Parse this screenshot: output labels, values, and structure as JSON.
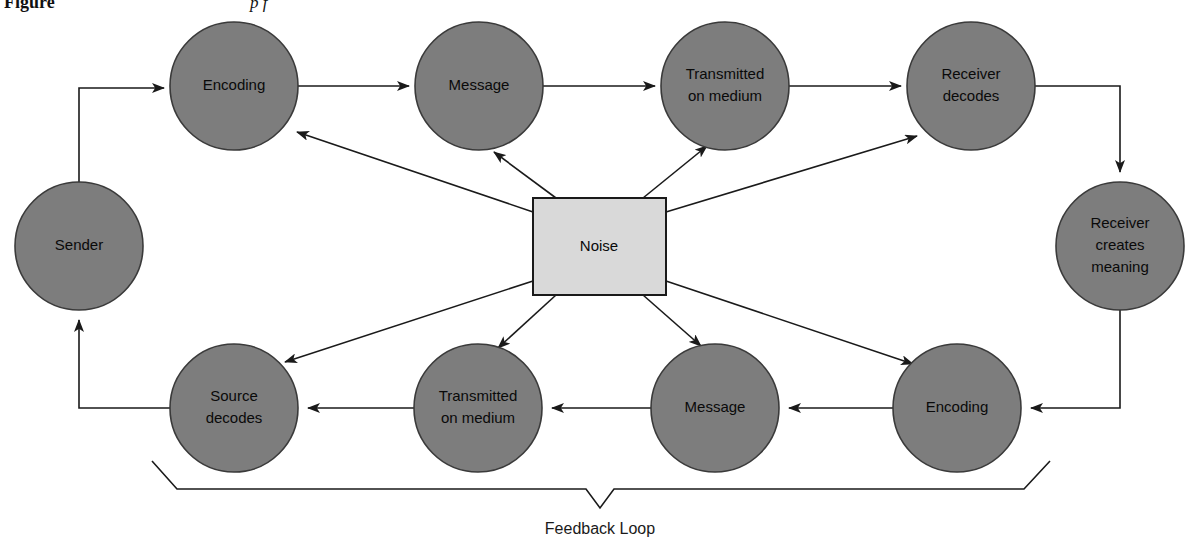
{
  "figure": {
    "caption_label": "Figure",
    "caption_text": "p            f",
    "feedback_label": "Feedback Loop"
  },
  "colors": {
    "circle_fill": "#7d7d7d",
    "circle_stroke": "#3a3a3a",
    "noise_fill": "#d9d9d9",
    "noise_stroke": "#1a1a1a",
    "line": "#1a1a1a",
    "background": "#ffffff",
    "text": "#0a0a0a"
  },
  "diagram": {
    "nodes": [
      {
        "id": "sender",
        "label": "Sender",
        "lines": [
          "Sender"
        ],
        "cx": 79,
        "cy": 246,
        "r": 64,
        "shape": "circle",
        "row": "left"
      },
      {
        "id": "encoding-top",
        "label": "Encoding",
        "lines": [
          "Encoding"
        ],
        "cx": 234,
        "cy": 86,
        "r": 64,
        "shape": "circle",
        "row": "top"
      },
      {
        "id": "message-top",
        "label": "Message",
        "lines": [
          "Message"
        ],
        "cx": 479,
        "cy": 86,
        "r": 64,
        "shape": "circle",
        "row": "top"
      },
      {
        "id": "transmitted-top",
        "label": "Transmitted on medium",
        "lines": [
          "Transmitted",
          "on medium"
        ],
        "cx": 725,
        "cy": 86,
        "r": 64,
        "shape": "circle",
        "row": "top"
      },
      {
        "id": "receiver-decodes",
        "label": "Receiver decodes",
        "lines": [
          "Receiver",
          "decodes"
        ],
        "cx": 971,
        "cy": 86,
        "r": 64,
        "shape": "circle",
        "row": "top"
      },
      {
        "id": "receiver-meaning",
        "label": "Receiver creates meaning",
        "lines": [
          "Receiver",
          "creates",
          "meaning"
        ],
        "cx": 1120,
        "cy": 246,
        "r": 64,
        "shape": "circle",
        "row": "right"
      },
      {
        "id": "encoding-bottom",
        "label": "Encoding",
        "lines": [
          "Encoding"
        ],
        "cx": 957,
        "cy": 408,
        "r": 64,
        "shape": "circle",
        "row": "bottom"
      },
      {
        "id": "message-bottom",
        "label": "Message",
        "lines": [
          "Message"
        ],
        "cx": 715,
        "cy": 408,
        "r": 64,
        "shape": "circle",
        "row": "bottom"
      },
      {
        "id": "transmitted-bottom",
        "label": "Transmitted on medium",
        "lines": [
          "Transmitted",
          "on medium"
        ],
        "cx": 478,
        "cy": 408,
        "r": 64,
        "shape": "circle",
        "row": "bottom"
      },
      {
        "id": "source-decodes",
        "label": "Source decodes",
        "lines": [
          "Source",
          "decodes"
        ],
        "cx": 234,
        "cy": 408,
        "r": 64,
        "shape": "circle",
        "row": "bottom"
      },
      {
        "id": "noise",
        "label": "Noise",
        "lines": [
          "Noise"
        ],
        "x": 533,
        "y": 198,
        "w": 133,
        "h": 97,
        "shape": "rect",
        "row": "center"
      }
    ],
    "edges": [
      {
        "from": "sender",
        "to": "encoding-top",
        "kind": "elbow"
      },
      {
        "from": "encoding-top",
        "to": "message-top",
        "kind": "straight"
      },
      {
        "from": "message-top",
        "to": "transmitted-top",
        "kind": "straight"
      },
      {
        "from": "transmitted-top",
        "to": "receiver-decodes",
        "kind": "straight"
      },
      {
        "from": "receiver-decodes",
        "to": "receiver-meaning",
        "kind": "elbow"
      },
      {
        "from": "receiver-meaning",
        "to": "encoding-bottom",
        "kind": "elbow"
      },
      {
        "from": "encoding-bottom",
        "to": "message-bottom",
        "kind": "straight"
      },
      {
        "from": "message-bottom",
        "to": "transmitted-bottom",
        "kind": "straight"
      },
      {
        "from": "transmitted-bottom",
        "to": "source-decodes",
        "kind": "straight"
      },
      {
        "from": "source-decodes",
        "to": "sender",
        "kind": "elbow"
      },
      {
        "from": "noise",
        "to": "encoding-top",
        "kind": "noise-ray"
      },
      {
        "from": "noise",
        "to": "message-top",
        "kind": "noise-ray"
      },
      {
        "from": "noise",
        "to": "transmitted-top",
        "kind": "noise-ray"
      },
      {
        "from": "noise",
        "to": "receiver-decodes",
        "kind": "noise-ray"
      },
      {
        "from": "noise",
        "to": "encoding-bottom",
        "kind": "noise-ray"
      },
      {
        "from": "noise",
        "to": "message-bottom",
        "kind": "noise-ray"
      },
      {
        "from": "noise",
        "to": "transmitted-bottom",
        "kind": "noise-ray"
      },
      {
        "from": "noise",
        "to": "source-decodes",
        "kind": "noise-ray"
      }
    ]
  }
}
